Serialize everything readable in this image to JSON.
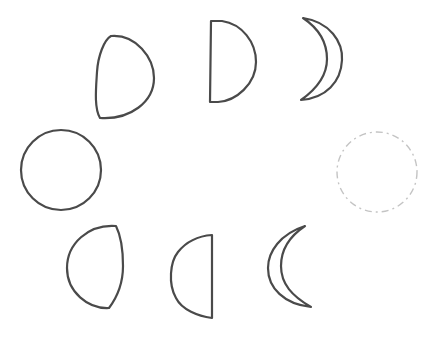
{
  "diagram": {
    "stroke_color": "#4a4a4a",
    "dashed_color": "#c4c4c4",
    "background": "#ffffff",
    "phases": [
      {
        "id": "waxing-gibbous",
        "label": "Waxing gibbous",
        "position": "top-left"
      },
      {
        "id": "first-quarter",
        "label": "First quarter",
        "position": "top-center"
      },
      {
        "id": "waxing-crescent",
        "label": "Waxing crescent",
        "position": "top-right"
      },
      {
        "id": "full-moon",
        "label": "Full moon",
        "position": "middle-left"
      },
      {
        "id": "new-moon",
        "label": "New moon",
        "position": "middle-right",
        "style": "dashed"
      },
      {
        "id": "waning-gibbous",
        "label": "Waning gibbous",
        "position": "bottom-left"
      },
      {
        "id": "third-quarter",
        "label": "Third quarter",
        "position": "bottom-center"
      },
      {
        "id": "waning-crescent",
        "label": "Waning crescent",
        "position": "bottom-right"
      }
    ]
  }
}
